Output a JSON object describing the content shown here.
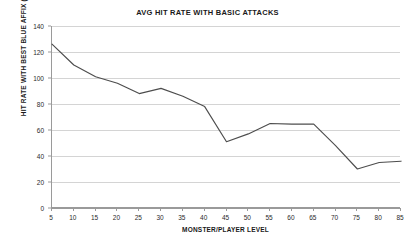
{
  "chart_data": {
    "type": "line",
    "title": "AVG HIT RATE WITH BASIC ATTACKS",
    "xlabel": "MONSTER/PLAYER LEVEL",
    "ylabel": "HIT RATE WITH BEST BLUE AFFIX (%)",
    "categories": [
      5,
      10,
      15,
      20,
      25,
      30,
      35,
      40,
      45,
      50,
      55,
      60,
      65,
      70,
      75,
      80,
      85
    ],
    "values": [
      126,
      110,
      101,
      96,
      88,
      92,
      86,
      78,
      51,
      57,
      65,
      64.5,
      64.5,
      48,
      30,
      35,
      36
    ],
    "x": [
      5,
      10,
      15,
      20,
      25,
      30,
      35,
      40,
      45,
      50,
      55,
      60,
      65,
      70,
      75,
      80,
      85
    ],
    "xlim": [
      5,
      85
    ],
    "ylim": [
      0,
      140
    ],
    "y_ticks": [
      0,
      20,
      40,
      60,
      80,
      100,
      120,
      140
    ],
    "x_ticks": [
      5,
      10,
      15,
      20,
      25,
      30,
      35,
      40,
      45,
      50,
      55,
      60,
      65,
      70,
      75,
      80,
      85
    ],
    "grid": true,
    "legend": false,
    "series": [
      {
        "name": "AVG HIT RATE WITH BASIC ATTACKS",
        "color": "#4d4d4d",
        "values": [
          126,
          110,
          101,
          96,
          88,
          92,
          86,
          78,
          51,
          57,
          65,
          64.5,
          64.5,
          48,
          30,
          35,
          36
        ]
      }
    ],
    "colors": {
      "line": "#4d4d4d",
      "grid": "#d4d4d4",
      "axis": "#9a9a9a",
      "text": "#1a1a1a",
      "background": "#ffffff"
    }
  }
}
